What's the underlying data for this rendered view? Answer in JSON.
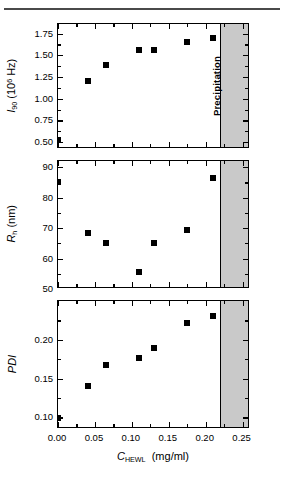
{
  "figure": {
    "precipitation_label": "Precipitation",
    "precipitation_start": 0.222,
    "marker_color": "#000000",
    "shade_color": "#c9c9c9",
    "axis_color": "#000000",
    "xaxis": {
      "title_symbol": "C",
      "title_subscript": "HEWL",
      "title_units": "(mg/ml)",
      "title": "C_HEWL (mg/ml)",
      "min": 0.0,
      "max": 0.26,
      "ticks": [
        0.0,
        0.05,
        0.1,
        0.15,
        0.2,
        0.25
      ],
      "tick_labels": [
        "0.00",
        "0.05",
        "0.10",
        "0.15",
        "0.20",
        "0.25"
      ],
      "minor_ticks": [
        0.025,
        0.075,
        0.125,
        0.175,
        0.225
      ]
    }
  },
  "chart_data": [
    {
      "type": "scatter",
      "panel": "top",
      "title": "",
      "xlabel": "C_HEWL (mg/ml)",
      "ylabel": "I_90 (10^6 Hz)",
      "ylabel_symbol": "I",
      "ylabel_subscript": "90",
      "ylabel_units_base": "(10",
      "ylabel_units_exp": "6",
      "ylabel_units_tail": " Hz)",
      "xlim": [
        0.0,
        0.26
      ],
      "ylim": [
        0.42,
        1.86
      ],
      "yticks": [
        0.5,
        0.75,
        1.0,
        1.25,
        1.5,
        1.75
      ],
      "ytick_labels": [
        "0.50",
        "0.75",
        "1.00",
        "1.25",
        "1.50",
        "1.75"
      ],
      "yminor_ticks": [
        0.625,
        0.875,
        1.125,
        1.375,
        1.625
      ],
      "grid": false,
      "legend": null,
      "x": [
        0.0,
        0.04,
        0.065,
        0.11,
        0.13,
        0.175,
        0.21
      ],
      "values": [
        0.525,
        1.205,
        1.385,
        1.565,
        1.558,
        1.655,
        1.7
      ]
    },
    {
      "type": "scatter",
      "panel": "middle",
      "title": "",
      "xlabel": "C_HEWL (mg/ml)",
      "ylabel": "R_h (nm)",
      "ylabel_symbol": "R",
      "ylabel_subscript": "h",
      "ylabel_units_base": "(nm)",
      "xlim": [
        0.0,
        0.26
      ],
      "ylim": [
        50,
        92
      ],
      "yticks": [
        50,
        60,
        70,
        80,
        90
      ],
      "ytick_labels": [
        "50",
        "60",
        "70",
        "80",
        "90"
      ],
      "yminor_ticks": [
        55,
        65,
        75,
        85
      ],
      "grid": false,
      "legend": null,
      "x": [
        0.0,
        0.04,
        0.065,
        0.11,
        0.13,
        0.175,
        0.21
      ],
      "values": [
        85.0,
        68.5,
        65.0,
        55.5,
        65.0,
        69.5,
        86.5
      ]
    },
    {
      "type": "scatter",
      "panel": "bottom",
      "title": "",
      "xlabel": "C_HEWL (mg/ml)",
      "ylabel": "PDI",
      "ylabel_symbol": "PDI",
      "xlim": [
        0.0,
        0.26
      ],
      "ylim": [
        0.085,
        0.25
      ],
      "yticks": [
        0.1,
        0.15,
        0.2
      ],
      "ytick_labels": [
        "0.10",
        "0.15",
        "0.20"
      ],
      "yminor_ticks": [
        0.125,
        0.175,
        0.225
      ],
      "grid": false,
      "legend": null,
      "x": [
        0.0,
        0.04,
        0.065,
        0.11,
        0.13,
        0.175,
        0.21
      ],
      "values": [
        0.099,
        0.141,
        0.168,
        0.176,
        0.19,
        0.221,
        0.231
      ]
    }
  ]
}
